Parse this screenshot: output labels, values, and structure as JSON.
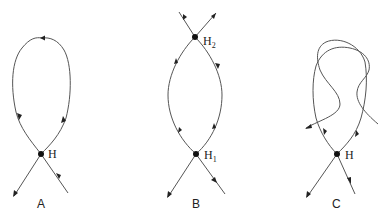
{
  "panels": [
    {
      "id": "A",
      "label": "A",
      "points": [
        {
          "name": "H",
          "sub": ""
        }
      ]
    },
    {
      "id": "B",
      "label": "B",
      "points": [
        {
          "name": "H",
          "sub": "2"
        },
        {
          "name": "H",
          "sub": "1"
        }
      ]
    },
    {
      "id": "C",
      "label": "C",
      "points": [
        {
          "name": "H",
          "sub": ""
        }
      ]
    }
  ],
  "colors": {
    "stroke": "#555555",
    "point": "#111111",
    "background": "#ffffff"
  }
}
